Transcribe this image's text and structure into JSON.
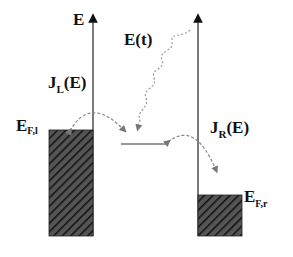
{
  "diagram": {
    "axis_label": "E",
    "field_label": "E(t)",
    "left_current": {
      "main": "J",
      "sub": "L",
      "arg": "(E)"
    },
    "right_current": {
      "main": "J",
      "sub": "R",
      "arg": "(E)"
    },
    "left_fermi": {
      "main": "E",
      "sub": "F,l"
    },
    "right_fermi": {
      "main": "E",
      "sub": "F,r"
    },
    "colors": {
      "ink": "#111111",
      "hatch_bg": "#3a3a3a",
      "hatch_line": "#111111",
      "dashed": "#888888"
    }
  }
}
